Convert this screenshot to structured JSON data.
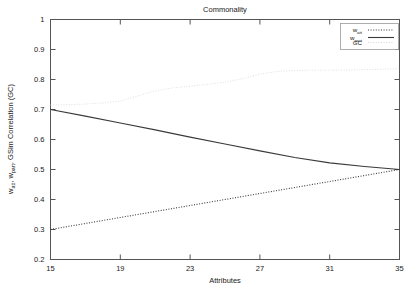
{
  "chart_data": {
    "type": "line",
    "title": "Commonality",
    "xlabel": "Attributes",
    "ylabel": "w_att, w_part, GSim Correlation (GC)",
    "ylabel_parts": [
      {
        "text": "w",
        "sub": false
      },
      {
        "text": "att",
        "sub": true
      },
      {
        "text": ", w",
        "sub": false
      },
      {
        "text": "part",
        "sub": true
      },
      {
        "text": ", GSim Correlation (GC)",
        "sub": false
      }
    ],
    "xlim": [
      15,
      35
    ],
    "ylim": [
      0.2,
      1
    ],
    "xticks": [
      15,
      19,
      23,
      27,
      31,
      35
    ],
    "xticklabels": [
      "15",
      "19",
      "23",
      "27",
      "31",
      "35"
    ],
    "yticks": [
      0.2,
      0.3,
      0.4,
      0.5,
      0.6,
      0.7,
      0.8,
      0.9,
      1
    ],
    "yticklabels": [
      "0.2",
      "0.3",
      "0.4",
      "0.5",
      "0.6",
      "0.7",
      "0.8",
      "0.9",
      "1"
    ],
    "grid": false,
    "legend_position": "top-right",
    "series": [
      {
        "name": "w_att",
        "name_base": "w",
        "name_sub": "att",
        "style": "dotted",
        "color": "#3a3a3a",
        "x": [
          15,
          17,
          19,
          21,
          23,
          25,
          27,
          29,
          31,
          33,
          35
        ],
        "values": [
          0.3,
          0.32,
          0.34,
          0.36,
          0.38,
          0.4,
          0.42,
          0.44,
          0.46,
          0.48,
          0.5
        ]
      },
      {
        "name": "w_part",
        "name_base": "w",
        "name_sub": "part",
        "style": "solid",
        "color": "#3a3a3a",
        "x": [
          15,
          17,
          19,
          21,
          23,
          25,
          27,
          29,
          31,
          33,
          35
        ],
        "values": [
          0.7,
          0.678,
          0.655,
          0.632,
          0.608,
          0.585,
          0.562,
          0.54,
          0.522,
          0.51,
          0.5
        ]
      },
      {
        "name": "GC",
        "name_base": "GC",
        "name_sub": "",
        "style": "dotted",
        "color": "#e2e2e2",
        "x": [
          15,
          16,
          17,
          18,
          19,
          20,
          21,
          22,
          23,
          24,
          25,
          26,
          27,
          28,
          29,
          30,
          31,
          32,
          33,
          34,
          35
        ],
        "values": [
          0.715,
          0.716,
          0.718,
          0.722,
          0.728,
          0.745,
          0.762,
          0.772,
          0.778,
          0.784,
          0.791,
          0.803,
          0.818,
          0.827,
          0.83,
          0.831,
          0.831,
          0.832,
          0.833,
          0.834,
          0.836
        ]
      }
    ]
  },
  "legend": {
    "entries": [
      {
        "label": "w",
        "sub": "att",
        "style": "dotted",
        "color": "#3a3a3a"
      },
      {
        "label": "w",
        "sub": "part",
        "style": "solid",
        "color": "#3a3a3a"
      },
      {
        "label": "GC",
        "sub": "",
        "style": "dotted",
        "color": "#d8d8d8"
      }
    ]
  }
}
